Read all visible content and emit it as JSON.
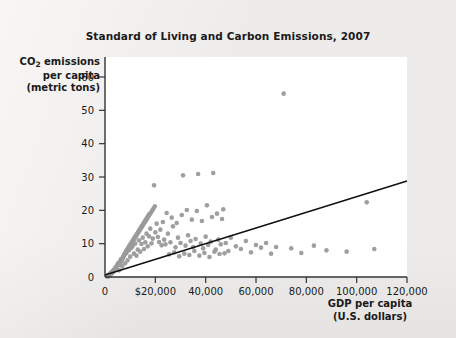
{
  "figure": {
    "background_color": "#eeecea",
    "plot_background_color": "#ffffff"
  },
  "chart_data": {
    "type": "scatter",
    "title": "Standard of Living and Carbon Emissions, 2007",
    "xlabel_line1": "GDP per capita",
    "xlabel_line2": "(U.S. dollars)",
    "ylabel_line1": "CO",
    "ylabel_sub": "2",
    "ylabel_line1_rest": " emissions",
    "ylabel_line2": "per capita",
    "ylabel_line3": "(metric tons)",
    "xlim": [
      0,
      120000
    ],
    "ylim": [
      0,
      66
    ],
    "grid": false,
    "legend": null,
    "point_color": "#9a9a9a",
    "point_radius": 2.3,
    "trendline_color": "#111111",
    "xticks": [
      0,
      20000,
      40000,
      60000,
      80000,
      100000,
      120000
    ],
    "xticklabels": [
      "0",
      "$20,000",
      "40,000",
      "60,000",
      "80,000",
      "100,000",
      "120,000"
    ],
    "yticks": [
      0,
      10,
      20,
      30,
      40,
      50,
      60
    ],
    "yticklabels": [
      "0",
      "10",
      "20",
      "30",
      "40",
      "50",
      "60"
    ],
    "trendline": {
      "x": [
        0,
        120000
      ],
      "y": [
        0.6,
        28.8
      ],
      "slope_per_dollar": 0.000235,
      "intercept": 0.6
    },
    "points": [
      [
        1200,
        0.3
      ],
      [
        1500,
        0.2
      ],
      [
        1800,
        0.5
      ],
      [
        900,
        0.1
      ],
      [
        1100,
        0.4
      ],
      [
        2000,
        0.6
      ],
      [
        2300,
        0.9
      ],
      [
        2600,
        1.1
      ],
      [
        1400,
        0.3
      ],
      [
        1700,
        0.7
      ],
      [
        2900,
        1.3
      ],
      [
        3200,
        1.6
      ],
      [
        1000,
        0.2
      ],
      [
        1300,
        0.5
      ],
      [
        2100,
        0.8
      ],
      [
        3500,
        1.9
      ],
      [
        3800,
        2.3
      ],
      [
        2400,
        1.0
      ],
      [
        2700,
        1.4
      ],
      [
        4100,
        2.6
      ],
      [
        4400,
        3.0
      ],
      [
        1600,
        0.6
      ],
      [
        1900,
        0.9
      ],
      [
        3000,
        1.5
      ],
      [
        4700,
        3.4
      ],
      [
        5000,
        3.8
      ],
      [
        2200,
        1.1
      ],
      [
        2500,
        1.3
      ],
      [
        3300,
        1.8
      ],
      [
        5300,
        4.2
      ],
      [
        5600,
        2.0
      ],
      [
        6000,
        4.8
      ],
      [
        3600,
        2.1
      ],
      [
        2800,
        1.4
      ],
      [
        6400,
        5.4
      ],
      [
        6800,
        3.2
      ],
      [
        7200,
        6.0
      ],
      [
        4000,
        2.5
      ],
      [
        3100,
        1.7
      ],
      [
        7600,
        6.6
      ],
      [
        8000,
        4.1
      ],
      [
        8500,
        7.2
      ],
      [
        4500,
        2.9
      ],
      [
        3400,
        2.0
      ],
      [
        9000,
        5.0
      ],
      [
        9500,
        8.0
      ],
      [
        5200,
        3.6
      ],
      [
        3700,
        2.2
      ],
      [
        10000,
        6.1
      ],
      [
        10500,
        8.7
      ],
      [
        5800,
        4.0
      ],
      [
        4200,
        2.7
      ],
      [
        11000,
        9.3
      ],
      [
        11500,
        7.0
      ],
      [
        6200,
        4.5
      ],
      [
        4800,
        3.1
      ],
      [
        12000,
        10.0
      ],
      [
        12500,
        6.4
      ],
      [
        6600,
        5.1
      ],
      [
        5100,
        3.5
      ],
      [
        13000,
        8.2
      ],
      [
        13500,
        11.0
      ],
      [
        7000,
        5.6
      ],
      [
        5500,
        3.9
      ],
      [
        14000,
        7.6
      ],
      [
        14500,
        9.9
      ],
      [
        7400,
        6.2
      ],
      [
        5900,
        4.3
      ],
      [
        15000,
        11.8
      ],
      [
        15500,
        8.4
      ],
      [
        7900,
        6.8
      ],
      [
        6300,
        4.7
      ],
      [
        16000,
        10.4
      ],
      [
        16500,
        13.0
      ],
      [
        8300,
        7.4
      ],
      [
        6700,
        5.2
      ],
      [
        17000,
        9.2
      ],
      [
        17500,
        12.2
      ],
      [
        8800,
        8.0
      ],
      [
        7100,
        5.7
      ],
      [
        18000,
        14.5
      ],
      [
        18500,
        10.1
      ],
      [
        9300,
        8.6
      ],
      [
        7500,
        6.3
      ],
      [
        19000,
        11.5
      ],
      [
        19500,
        27.5
      ],
      [
        9800,
        9.2
      ],
      [
        7800,
        6.9
      ],
      [
        20000,
        13.4
      ],
      [
        20500,
        16.0
      ],
      [
        10300,
        9.8
      ],
      [
        8200,
        7.5
      ],
      [
        21000,
        12.0
      ],
      [
        21500,
        10.5
      ],
      [
        10800,
        10.4
      ],
      [
        8600,
        8.1
      ],
      [
        22000,
        14.2
      ],
      [
        22500,
        9.5
      ],
      [
        11300,
        11.0
      ],
      [
        9100,
        8.7
      ],
      [
        23000,
        16.5
      ],
      [
        23500,
        11.2
      ],
      [
        11800,
        11.6
      ],
      [
        9600,
        9.3
      ],
      [
        24000,
        9.8
      ],
      [
        25000,
        13.0
      ],
      [
        12300,
        12.2
      ],
      [
        10100,
        9.9
      ],
      [
        26000,
        10.4
      ],
      [
        27000,
        15.2
      ],
      [
        12800,
        12.8
      ],
      [
        10600,
        10.5
      ],
      [
        28000,
        8.9
      ],
      [
        29000,
        11.8
      ],
      [
        13300,
        13.4
      ],
      [
        11100,
        11.1
      ],
      [
        30000,
        10.2
      ],
      [
        31000,
        30.5
      ],
      [
        13800,
        14.0
      ],
      [
        11600,
        11.7
      ],
      [
        32000,
        9.4
      ],
      [
        33000,
        12.5
      ],
      [
        14300,
        14.6
      ],
      [
        12100,
        12.3
      ],
      [
        34000,
        10.8
      ],
      [
        35000,
        9.0
      ],
      [
        14800,
        15.2
      ],
      [
        12600,
        12.9
      ],
      [
        36000,
        11.4
      ],
      [
        37000,
        30.9
      ],
      [
        15300,
        15.8
      ],
      [
        13100,
        13.5
      ],
      [
        38000,
        10.0
      ],
      [
        39000,
        8.6
      ],
      [
        15800,
        16.4
      ],
      [
        13600,
        14.1
      ],
      [
        40000,
        12.1
      ],
      [
        41000,
        9.6
      ],
      [
        16300,
        17.0
      ],
      [
        14100,
        14.7
      ],
      [
        42000,
        10.6
      ],
      [
        43000,
        31.2
      ],
      [
        16800,
        17.6
      ],
      [
        14600,
        15.3
      ],
      [
        44000,
        8.2
      ],
      [
        45000,
        11.2
      ],
      [
        17300,
        18.2
      ],
      [
        15100,
        15.9
      ],
      [
        46000,
        9.8
      ],
      [
        47000,
        20.3
      ],
      [
        17800,
        18.8
      ],
      [
        15600,
        16.5
      ],
      [
        48000,
        10.2
      ],
      [
        49000,
        7.8
      ],
      [
        18300,
        19.4
      ],
      [
        16100,
        17.1
      ],
      [
        50000,
        11.8
      ],
      [
        52000,
        9.2
      ],
      [
        18800,
        20.0
      ],
      [
        16600,
        17.7
      ],
      [
        54000,
        8.4
      ],
      [
        56000,
        10.8
      ],
      [
        19300,
        20.6
      ],
      [
        17100,
        18.3
      ],
      [
        58000,
        7.4
      ],
      [
        60000,
        9.6
      ],
      [
        19800,
        21.2
      ],
      [
        17600,
        18.9
      ],
      [
        62000,
        8.8
      ],
      [
        64000,
        10.2
      ],
      [
        66000,
        7.0
      ],
      [
        68000,
        9.0
      ],
      [
        71000,
        55.0
      ],
      [
        74000,
        8.6
      ],
      [
        78000,
        7.2
      ],
      [
        83000,
        9.4
      ],
      [
        88000,
        8.0
      ],
      [
        96000,
        7.6
      ],
      [
        104000,
        22.4
      ],
      [
        107000,
        8.4
      ],
      [
        24500,
        19.2
      ],
      [
        26500,
        17.8
      ],
      [
        28500,
        16.2
      ],
      [
        30500,
        18.6
      ],
      [
        32500,
        20.1
      ],
      [
        34500,
        17.2
      ],
      [
        36500,
        19.8
      ],
      [
        38500,
        16.8
      ],
      [
        40500,
        21.5
      ],
      [
        42500,
        18.0
      ],
      [
        44500,
        19.0
      ],
      [
        46500,
        17.4
      ],
      [
        25500,
        6.8
      ],
      [
        27500,
        7.4
      ],
      [
        29500,
        6.2
      ],
      [
        31500,
        7.0
      ],
      [
        33500,
        6.6
      ],
      [
        35500,
        7.8
      ],
      [
        37500,
        6.4
      ],
      [
        39500,
        7.2
      ],
      [
        41500,
        6.0
      ],
      [
        43500,
        7.6
      ],
      [
        45500,
        6.9
      ],
      [
        47500,
        7.1
      ]
    ]
  }
}
